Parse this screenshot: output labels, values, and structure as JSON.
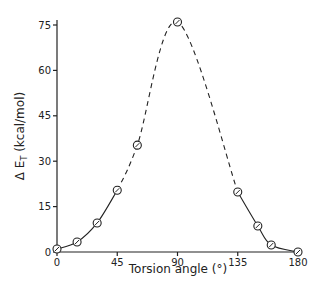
{
  "chart_data": {
    "type": "line",
    "title": "",
    "xlabel": "Torsion angle (°)",
    "ylabel_prefix": "Δ E",
    "ylabel_sub": "T",
    "ylabel_suffix": " (kcal/mol)",
    "ylabel": "Δ E_T (kcal/mol)",
    "xlim": [
      0,
      180
    ],
    "ylim": [
      0,
      75
    ],
    "xticks": [
      0,
      45,
      90,
      135,
      180
    ],
    "yticks": [
      0,
      15,
      30,
      45,
      60,
      75
    ],
    "grid": false,
    "legend": null,
    "series": [
      {
        "name": "ΔE_T",
        "marker": "circle-dot",
        "x": [
          0,
          15,
          30,
          45,
          60,
          90,
          135,
          150,
          160,
          180
        ],
        "y": [
          1.0,
          3.3,
          9.6,
          20.4,
          35.3,
          76.0,
          19.8,
          8.6,
          2.3,
          0.0
        ]
      }
    ],
    "line_segments": [
      {
        "style": "solid",
        "x_range": [
          0,
          45
        ]
      },
      {
        "style": "dashed",
        "x_range": [
          45,
          135
        ]
      },
      {
        "style": "solid",
        "x_range": [
          135,
          180
        ]
      }
    ]
  }
}
